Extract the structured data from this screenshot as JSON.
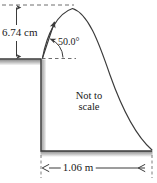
{
  "figure": {
    "caption_note": {
      "line1": "Not to",
      "line2": "scale"
    },
    "measurements": {
      "launch_height": {
        "value": "6.74",
        "unit": "cm",
        "text": "6.74 cm"
      },
      "launch_angle": {
        "value": "50.0",
        "unit": "°",
        "text": "50.0°"
      },
      "horizontal_range": {
        "value": "1.06",
        "unit": "m",
        "text": "1.06 m"
      }
    },
    "colors": {
      "stroke": "#3b3b3b",
      "dashed": "#6e6e6e",
      "ground_fill": "#b5b5b5",
      "shadow": "#c9c9c9",
      "text": "#1a1a1a",
      "background": "#ffffff"
    },
    "elements": {
      "trajectory_curve": "projectile-arc",
      "velocity_arrow": "launch-velocity-arrow",
      "angle_arc": "angle-arc-50",
      "height_dimension_arrow": "vertical-double-arrow",
      "width_dimension_arrow": "horizontal-double-arrow",
      "apex_dashed_line": "apex-reference-dashed",
      "horizon_dashed_line": "launch-horizontal-dashed",
      "cliff": "cliff-block"
    }
  }
}
